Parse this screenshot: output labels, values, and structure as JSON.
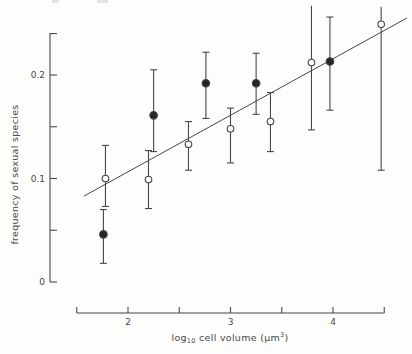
{
  "figure": {
    "bg_color": "#fdfdfb",
    "ink_color": "#474747",
    "marker_fill_color": "#262626"
  },
  "y_axis": {
    "label": "frequency of sexual species",
    "ticks": [
      {
        "value": 0,
        "label": "0"
      },
      {
        "value": 0.05,
        "label": ""
      },
      {
        "value": 0.1,
        "label": "0.1"
      },
      {
        "value": 0.15,
        "label": ""
      },
      {
        "value": 0.2,
        "label": "0.2"
      }
    ]
  },
  "x_axis": {
    "label_parts": {
      "prefix": "log",
      "sub": "10",
      "mid": " cell volume (µm",
      "sup": "3",
      "suffix": ")"
    },
    "ticks": [
      {
        "value": 2,
        "label": "2"
      },
      {
        "value": 2.5,
        "label": ""
      },
      {
        "value": 3,
        "label": "3"
      },
      {
        "value": 3.5,
        "label": ""
      },
      {
        "value": 4,
        "label": "4"
      }
    ]
  },
  "chart_data": {
    "type": "scatter",
    "title": "",
    "xlabel": "log10 cell volume (um^3)",
    "ylabel": "frequency of sexual species",
    "xlim": [
      1.5,
      4.5
    ],
    "ylim": [
      0,
      0.24
    ],
    "x_tick_values": [
      1.5,
      2,
      2.5,
      3,
      3.5,
      4,
      4.5
    ],
    "y_tick_values": [
      0,
      0.05,
      0.1,
      0.15,
      0.2
    ],
    "grid": false,
    "legend": "none",
    "series": [
      {
        "name": "filled circles",
        "marker": "filled-circle",
        "points": [
          {
            "x": 1.76,
            "y": 0.046,
            "lo": 0.018,
            "hi": 0.07
          },
          {
            "x": 2.25,
            "y": 0.161,
            "lo": 0.126,
            "hi": 0.205
          },
          {
            "x": 2.76,
            "y": 0.192,
            "lo": 0.158,
            "hi": 0.222
          },
          {
            "x": 3.25,
            "y": 0.192,
            "lo": 0.162,
            "hi": 0.221
          },
          {
            "x": 3.97,
            "y": 0.213,
            "lo": 0.166,
            "hi": 0.256
          }
        ]
      },
      {
        "name": "open circles",
        "marker": "open-circle",
        "points": [
          {
            "x": 1.78,
            "y": 0.1,
            "lo": 0.073,
            "hi": 0.132
          },
          {
            "x": 2.2,
            "y": 0.099,
            "lo": 0.071,
            "hi": 0.127
          },
          {
            "x": 2.59,
            "y": 0.133,
            "lo": 0.108,
            "hi": 0.155
          },
          {
            "x": 3.0,
            "y": 0.148,
            "lo": 0.115,
            "hi": 0.168
          },
          {
            "x": 3.39,
            "y": 0.155,
            "lo": 0.126,
            "hi": 0.183
          },
          {
            "x": 3.79,
            "y": 0.212,
            "lo": 0.147,
            "hi": 0.267,
            "cap_top": false
          },
          {
            "x": 4.47,
            "y": 0.249,
            "lo": 0.108,
            "hi": 0.266,
            "cap_top": false
          }
        ]
      }
    ],
    "fit_line": {
      "x1": 1.57,
      "y1": 0.083,
      "x2": 4.72,
      "y2": 0.255
    },
    "plot_mapping": {
      "x_value_at_origin": 2,
      "x_px_at_origin": 128,
      "px_per_x_unit": 102.5,
      "y_value_at_origin": 0,
      "y_px_at_origin": 282,
      "px_per_y_unit": 1035,
      "y_axis_x_px": 50,
      "y_axis_top_px": 33,
      "x_axis_y_px": 313
    }
  }
}
